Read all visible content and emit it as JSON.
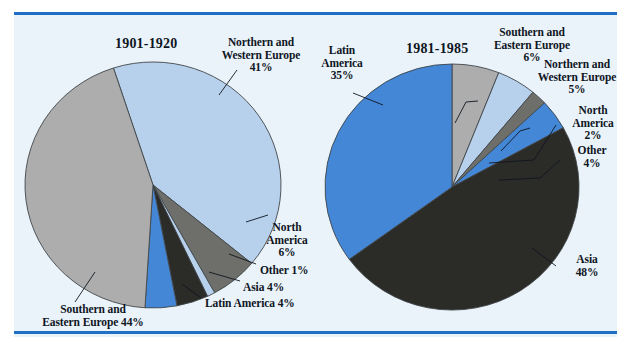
{
  "figure": {
    "background": "#eaf3fa",
    "rule_color": "#1f6fc4",
    "text_color": "#10161f"
  },
  "palette": {
    "light_blue": "#b7d0ec",
    "gray": "#adadad",
    "medium_blue": "#4387d6",
    "dark": "#2b2b28",
    "slate_gray": "#6e6f6a",
    "outline": "#41464a"
  },
  "chart_data": [
    {
      "type": "pie",
      "title": "1901-1920",
      "categories": [
        "Northern and Western Europe",
        "North America",
        "Other",
        "Asia",
        "Latin America",
        "Southern and Eastern Europe"
      ],
      "values": [
        41,
        6,
        1,
        4,
        4,
        44
      ],
      "value_labels": [
        "41%",
        "6%",
        "1%",
        "4%",
        "4%",
        "44%"
      ],
      "colors": [
        "#b7d0ec",
        "#6e6f6a",
        "#b7d0ec",
        "#2b2b28",
        "#4387d6",
        "#adadad"
      ],
      "start_angle_deg": -18,
      "legend": "callout-labels"
    },
    {
      "type": "pie",
      "title": "1981-1985",
      "categories": [
        "Southern and Eastern Europe",
        "Northern and Western Europe",
        "North America",
        "Other",
        "Asia",
        "Latin America"
      ],
      "values": [
        6,
        5,
        2,
        4,
        48,
        35
      ],
      "value_labels": [
        "6%",
        "5%",
        "2%",
        "4%",
        "48%",
        "35%"
      ],
      "colors": [
        "#adadad",
        "#b7d0ec",
        "#6e6f6a",
        "#4387d6",
        "#2b2b28",
        "#4387d6"
      ],
      "start_angle_deg": 0,
      "legend": "callout-labels"
    }
  ],
  "left_chart": {
    "title": "1901-1920",
    "labels": {
      "nw_europe": {
        "line1": "Northern and",
        "line2": "Western Europe",
        "line3": "41%"
      },
      "north_america": {
        "line1": "North",
        "line2": "America",
        "line3": "6%"
      },
      "other": {
        "line1": "Other 1%"
      },
      "asia": {
        "line1": "Asia 4%"
      },
      "latin_america": {
        "line1": "Latin America 4%"
      },
      "se_europe": {
        "line1": "Southern and",
        "line2": "Eastern Europe 44%"
      }
    }
  },
  "right_chart": {
    "title": "1981-1985",
    "labels": {
      "latin_america": {
        "line1": "Latin",
        "line2": "America",
        "line3": "35%"
      },
      "se_europe": {
        "line1": "Southern and",
        "line2": "Eastern Europe",
        "line3": "6%"
      },
      "nw_europe": {
        "line1": "Northern and",
        "line2": "Western Europe",
        "line3": "5%"
      },
      "north_america": {
        "line1": "North",
        "line2": "America",
        "line3": "2%"
      },
      "other": {
        "line1": "Other",
        "line2": "4%"
      },
      "asia": {
        "line1": "Asia",
        "line2": "48%"
      }
    }
  }
}
